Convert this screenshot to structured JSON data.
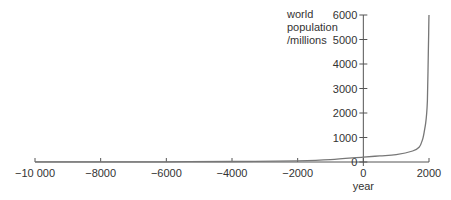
{
  "chart_data": {
    "type": "line",
    "title": "",
    "xlabel": "year",
    "ylabel": "world population /millions",
    "ylabel_lines": [
      "world",
      "population",
      "/millions"
    ],
    "xlim": [
      -10000,
      2000
    ],
    "ylim": [
      0,
      6000
    ],
    "grid": false,
    "legend": null,
    "x_ticks": [
      -10000,
      -8000,
      -6000,
      -4000,
      -2000,
      0,
      2000
    ],
    "x_tick_labels": [
      "−10 000",
      "−8000",
      "−6000",
      "−4000",
      "−2000",
      "0",
      "2000"
    ],
    "y_ticks": [
      0,
      1000,
      2000,
      3000,
      4000,
      5000,
      6000
    ],
    "y_tick_labels": [
      "0",
      "1000",
      "2000",
      "3000",
      "4000",
      "5000",
      "6000"
    ],
    "series": [
      {
        "name": "world population",
        "color": "#777777",
        "x": [
          -10000,
          -8000,
          -6000,
          -4000,
          -2000,
          -1000,
          0,
          500,
          1000,
          1500,
          1700,
          1800,
          1850,
          1900,
          1930,
          1950,
          1970,
          1990,
          2000
        ],
        "values": [
          5,
          8,
          10,
          20,
          50,
          100,
          200,
          250,
          300,
          450,
          600,
          900,
          1200,
          1600,
          2000,
          2500,
          3700,
          5300,
          6000
        ]
      }
    ]
  },
  "colors": {
    "axis": "#555555",
    "line": "#777777",
    "text": "#333333"
  }
}
